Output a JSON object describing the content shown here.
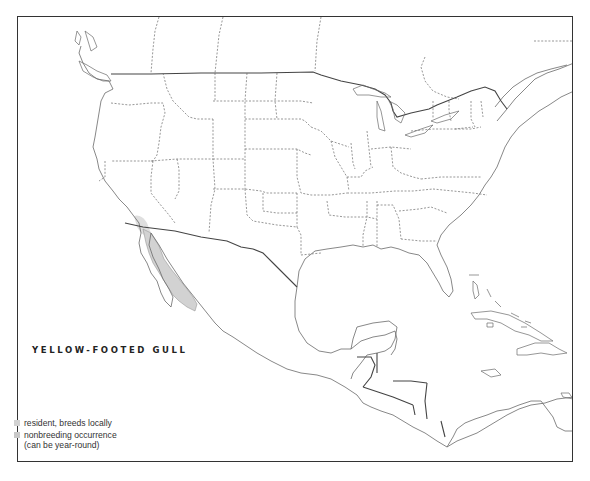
{
  "map": {
    "title": "YELLOW-FOOTED GULL",
    "region": "North and Central America",
    "range_color_resident": "#d2d2d2",
    "range_color_nonbreeding": "#c8c8c8",
    "coastline_color": "#6a6a6a",
    "frame_color": "#333333"
  },
  "legend": {
    "items": [
      {
        "label": "resident, breeds locally",
        "color": "#d2d2d2"
      },
      {
        "label": "nonbreeding occurrence",
        "sublabel": "(can be year-round)",
        "color": "#c8c8c8"
      }
    ]
  }
}
